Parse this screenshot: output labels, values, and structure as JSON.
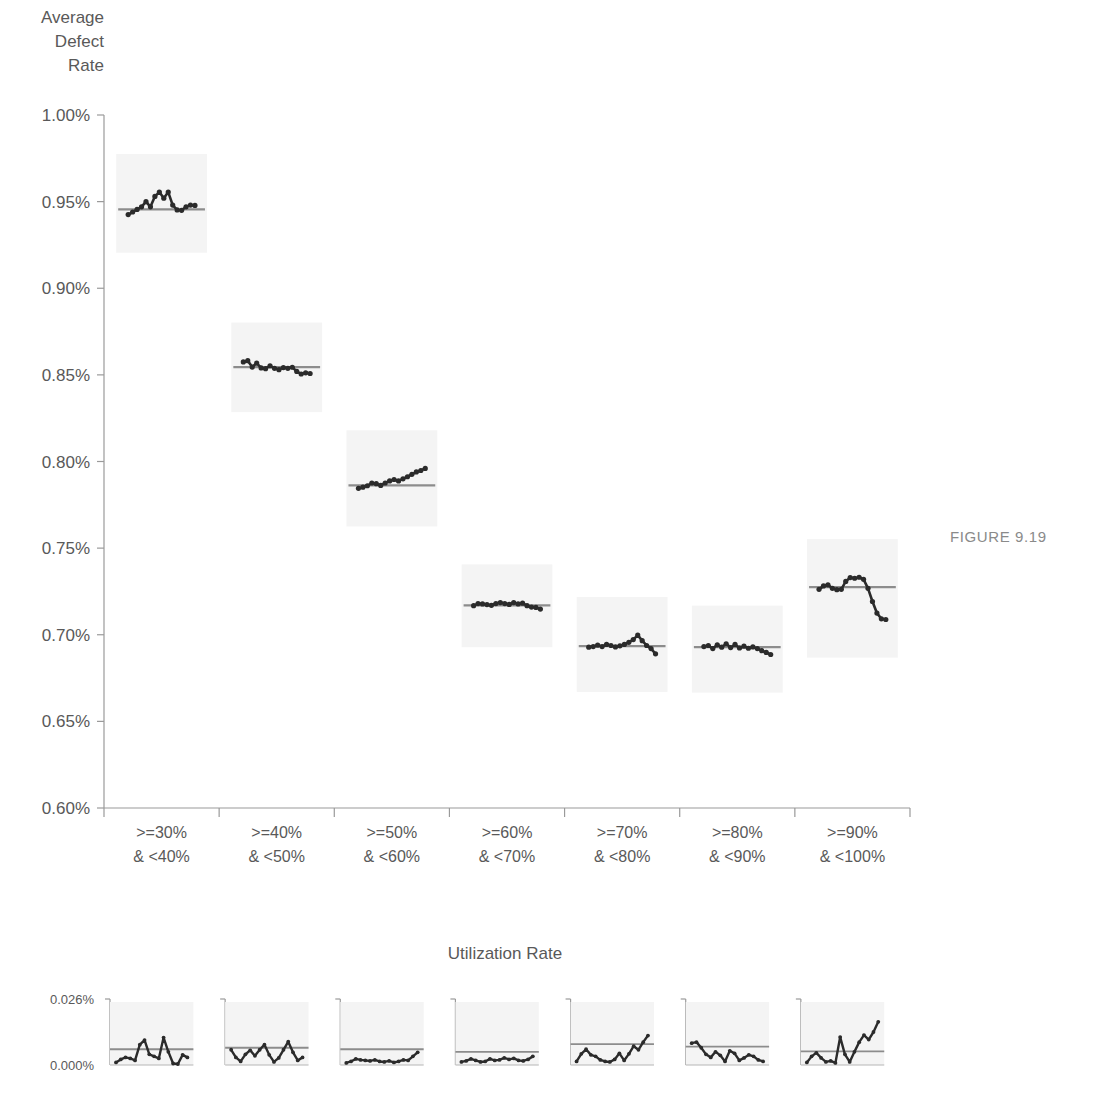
{
  "figure": {
    "caption": "FIGURE 9.19"
  },
  "chart_data": {
    "type": "line",
    "title": "",
    "subtitle": "",
    "ylabel": "Average\nDefect\nRate",
    "xlabel": "Utilization Rate",
    "grid": false,
    "legend": "none",
    "ylim": [
      0.006,
      0.01
    ],
    "ytick_labels": [
      "1.00%",
      "0.95%",
      "0.90%",
      "0.85%",
      "0.80%",
      "0.75%",
      "0.70%",
      "0.65%",
      "0.60%"
    ],
    "ytick_values": [
      0.01,
      0.0095,
      0.009,
      0.0085,
      0.008,
      0.0075,
      0.007,
      0.0065,
      0.006
    ],
    "categories": [
      ">=30%\n& <40%",
      ">=40%\n& <50%",
      ">=50%\n& <60%",
      ">=60%\n& <70%",
      ">=70%\n& <80%",
      ">=80%\n& <90%",
      ">=90%\n& <100%"
    ],
    "category_labels_line1": [
      ">=30%",
      ">=40%",
      ">=50%",
      ">=60%",
      ">=70%",
      ">=80%",
      ">=90%"
    ],
    "category_labels_line2": [
      "& <40%",
      "& <50%",
      "& <60%",
      "& <70%",
      "& <80%",
      "& <90%",
      "& <100%"
    ],
    "panels": [
      {
        "category": ">=30% & <40%",
        "mean": 0.009455,
        "values": [
          0.009425,
          0.00944,
          0.009455,
          0.00947,
          0.0095,
          0.00947,
          0.00953,
          0.009555,
          0.00952,
          0.009555,
          0.00948,
          0.009452,
          0.00945,
          0.00947,
          0.00948,
          0.009478
        ]
      },
      {
        "category": ">=40% & <50%",
        "mean": 0.008545,
        "values": [
          0.008575,
          0.008582,
          0.008545,
          0.008568,
          0.00854,
          0.008536,
          0.008552,
          0.008538,
          0.00853,
          0.008542,
          0.008538,
          0.008544,
          0.00852,
          0.008505,
          0.008512,
          0.008508
        ]
      },
      {
        "category": ">=50% & <60%",
        "mean": 0.007862,
        "values": [
          0.007845,
          0.007852,
          0.00786,
          0.007876,
          0.007872,
          0.007862,
          0.007876,
          0.007888,
          0.007896,
          0.007888,
          0.0079,
          0.007912,
          0.007926,
          0.00794,
          0.007948,
          0.00796
        ]
      },
      {
        "category": ">=60% & <70%",
        "mean": 0.00717,
        "values": [
          0.007168,
          0.00718,
          0.007178,
          0.007174,
          0.00717,
          0.00718,
          0.007186,
          0.00718,
          0.007175,
          0.007186,
          0.007178,
          0.007182,
          0.007168,
          0.00716,
          0.007158,
          0.007148
        ]
      },
      {
        "category": ">=70% & <80%",
        "mean": 0.006934,
        "values": [
          0.006928,
          0.006932,
          0.00694,
          0.006932,
          0.006944,
          0.006938,
          0.00693,
          0.006936,
          0.006944,
          0.006956,
          0.006972,
          0.006998,
          0.006966,
          0.006938,
          0.00692,
          0.00689
        ]
      },
      {
        "category": ">=80% & <90%",
        "mean": 0.006928,
        "values": [
          0.006932,
          0.006938,
          0.00692,
          0.006942,
          0.006928,
          0.006948,
          0.006926,
          0.006944,
          0.006924,
          0.006934,
          0.006922,
          0.00693,
          0.00692,
          0.006908,
          0.006898,
          0.006886
        ]
      },
      {
        "category": ">=90% & <100%",
        "mean": 0.007275,
        "values": [
          0.007262,
          0.007282,
          0.007288,
          0.007268,
          0.00726,
          0.007262,
          0.007308,
          0.00733,
          0.007326,
          0.007332,
          0.00732,
          0.007268,
          0.007192,
          0.007125,
          0.007092,
          0.007088
        ]
      }
    ]
  },
  "residual_chart": {
    "type": "line",
    "ylim": [
      0.0,
      0.00026
    ],
    "ytick_labels": [
      "0.026%",
      "0.000%"
    ],
    "ytick_values": [
      0.00026,
      0.0
    ],
    "panels": [
      {
        "category": ">=30% & <40%",
        "mean": 6.2e-05,
        "values": [
          1e-05,
          2.2e-05,
          3e-05,
          2.6e-05,
          1.8e-05,
          8e-05,
          9.8e-05,
          4.2e-05,
          3.4e-05,
          2.6e-05,
          0.000108,
          5.2e-05,
          6e-06,
          4e-06,
          4e-05,
          3e-05
        ]
      },
      {
        "category": ">=40% & <50%",
        "mean": 6.8e-05,
        "values": [
          6e-05,
          3e-05,
          1.4e-05,
          4.2e-05,
          5.8e-05,
          3.6e-05,
          6e-05,
          8e-05,
          4e-05,
          1.2e-05,
          2.8e-05,
          6e-05,
          9.2e-05,
          5e-05,
          1.8e-05,
          3e-05
        ]
      },
      {
        "category": ">=50% & <60%",
        "mean": 6.2e-05,
        "values": [
          8e-06,
          1.4e-05,
          2.4e-05,
          2e-05,
          1.8e-05,
          1.6e-05,
          2e-05,
          1.4e-05,
          1.2e-05,
          1.6e-05,
          1e-05,
          1.4e-05,
          2e-05,
          1.8e-05,
          3.4e-05,
          5e-05
        ]
      },
      {
        "category": ">=60% & <70%",
        "mean": 5.2e-05,
        "values": [
          1.2e-05,
          1.6e-05,
          2.4e-05,
          1.8e-05,
          1.2e-05,
          1.4e-05,
          2.4e-05,
          1.8e-05,
          2e-05,
          2.8e-05,
          2.2e-05,
          2.6e-05,
          1.8e-05,
          1.6e-05,
          2.2e-05,
          3.4e-05
        ]
      },
      {
        "category": ">=70% & <80%",
        "mean": 8.2e-05,
        "values": [
          1.4e-05,
          4.4e-05,
          6.2e-05,
          4e-05,
          3.4e-05,
          2e-05,
          1.4e-05,
          1.2e-05,
          2.2e-05,
          4.6e-05,
          1.8e-05,
          4.4e-05,
          7.4e-05,
          6e-05,
          9e-05,
          0.000116
        ]
      },
      {
        "category": ">=80% & <90%",
        "mean": 7.2e-05,
        "values": [
          8.6e-05,
          9e-05,
          6.8e-05,
          4.2e-05,
          3e-05,
          5.2e-05,
          3.8e-05,
          1.4e-05,
          5.6e-05,
          4.6e-05,
          1.8e-05,
          2.8e-05,
          4e-05,
          3.4e-05,
          2e-05,
          1.4e-05
        ]
      },
      {
        "category": ">=90% & <100%",
        "mean": 5.4e-05,
        "values": [
          1e-05,
          3.4e-05,
          4.8e-05,
          2.8e-05,
          1.2e-05,
          1.6e-05,
          8e-06,
          0.00011,
          4.2e-05,
          1.2e-05,
          5.2e-05,
          9e-05,
          0.000118,
          0.0001,
          0.00013,
          0.00017
        ]
      }
    ]
  }
}
